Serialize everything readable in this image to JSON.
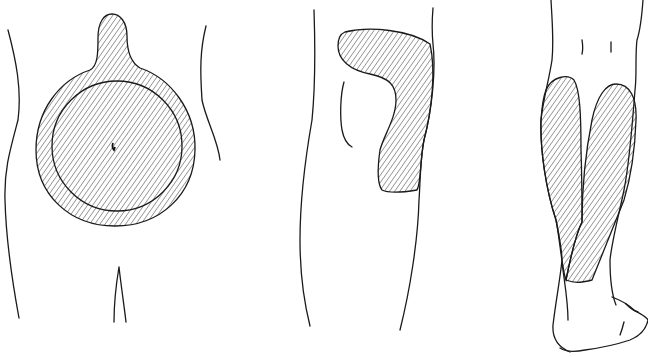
{
  "figure": {
    "panels": [
      {
        "id": "abdomen",
        "label": "Abdomen (front view)",
        "hatched_region": "Circular area around umbilicus with upward lobe, inner circle outlined"
      },
      {
        "id": "thigh",
        "label": "Thigh (lateral/front view)",
        "hatched_region": "Curved hook-shaped area on upper outer thigh"
      },
      {
        "id": "calf",
        "label": "Calf (posterior view)",
        "hatched_region": "Two elongated lobes over calf muscles converging toward the Achilles tendon"
      }
    ],
    "colors": {
      "line": "#1a1a1a",
      "background": "#ffffff"
    },
    "hatch_spacing_px": 4
  }
}
